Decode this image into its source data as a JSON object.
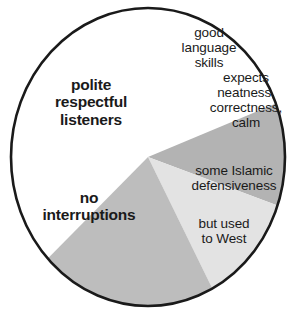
{
  "chart_data": {
    "type": "pie",
    "title": "",
    "subtitle": "",
    "xlabel": "",
    "ylabel": "",
    "legend_position": "none",
    "grid": false,
    "center": {
      "x": 148,
      "y": 157
    },
    "radius": {
      "rx": 137,
      "ry": 149
    },
    "outline_color": "#1a1a1a",
    "categories": [
      "polite respectful listeners / no interruptions",
      "good language skills",
      "expects neatness, correctness, calm",
      "some Islamic defensiveness / but used to West"
    ],
    "values": [
      55,
      11,
      12,
      22
    ],
    "slices": [
      {
        "name": "white-majority-slice",
        "label_lines": [
          "polite respectful listeners",
          "no interruptions"
        ],
        "color": "#ffffff",
        "start_angle_deg": 137,
        "end_angle_deg": 339,
        "share_pct": 55,
        "emphasis": "bold"
      },
      {
        "name": "good-language-skills-slice",
        "label_lines": [
          "good language skills"
        ],
        "color": "#b3b3b3",
        "start_angle_deg": 339,
        "end_angle_deg": 19,
        "share_pct": 11,
        "emphasis": "normal"
      },
      {
        "name": "expects-neatness-slice",
        "label_lines": [
          "expects neatness, correctness, calm"
        ],
        "color": "#e3e3e3",
        "start_angle_deg": 19,
        "end_angle_deg": 62,
        "share_pct": 12,
        "emphasis": "normal"
      },
      {
        "name": "islamic-defensiveness-slice",
        "label_lines": [
          "some Islamic defensiveness",
          "but used to West"
        ],
        "color": "#bdbdbd",
        "start_angle_deg": 62,
        "end_angle_deg": 137,
        "share_pct": 22,
        "emphasis": "normal"
      }
    ],
    "annotations": {
      "polite": "polite\nrespectful\nlisteners",
      "no_interruptions": "no\ninterruptions",
      "good_language": "good\nlanguage\nskills",
      "expects": "expects\nneatness,\ncorrectness,\ncalm",
      "islamic": "some Islamic\ndefensiveness",
      "west": "but used\nto West"
    }
  },
  "colors": {
    "background": "#ffffff",
    "outline": "#1a1a1a",
    "slice_white": "#ffffff",
    "slice_medium_gray": "#b3b3b3",
    "slice_light_gray": "#e3e3e3",
    "slice_gray": "#bdbdbd",
    "text": "#1a1a1a"
  }
}
